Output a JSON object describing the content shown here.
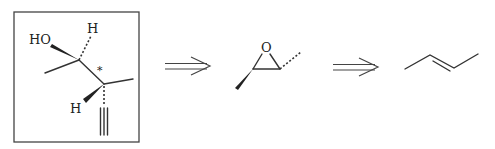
{
  "diagram": {
    "type": "retrosynthesis-scheme",
    "steps": [
      {
        "id": "target",
        "description": "boxed target molecule: 3-methylpent-4-yn-2-ol with defined stereocenters",
        "boxed": true,
        "atom_labels": {
          "hydroxyl": "HO",
          "h_top": "H",
          "h_bottom": "H",
          "stereo_marker": "*"
        }
      },
      {
        "id": "arrow-1",
        "description": "retrosynthetic arrow"
      },
      {
        "id": "epoxide",
        "description": "trans-2,3-dimethyloxirane",
        "atom_labels": {
          "oxygen": "O"
        }
      },
      {
        "id": "arrow-2",
        "description": "retrosynthetic arrow"
      },
      {
        "id": "alkene",
        "description": "trans-2-butene"
      }
    ]
  }
}
